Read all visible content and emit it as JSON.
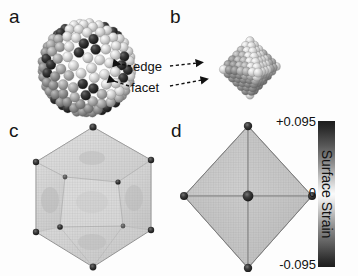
{
  "figure": {
    "panels": [
      {
        "id": "a",
        "letter": "a",
        "kind": "atomistic-icosahedron"
      },
      {
        "id": "b",
        "letter": "b",
        "kind": "atomistic-octahedron"
      },
      {
        "id": "c",
        "letter": "c",
        "kind": "continuum-icosahedron"
      },
      {
        "id": "d",
        "letter": "d",
        "kind": "continuum-octahedron"
      }
    ],
    "annotations": [
      {
        "name": "edge",
        "label": "edge"
      },
      {
        "name": "facet",
        "label": "facet"
      }
    ],
    "caption_sliver": ""
  },
  "colorbar": {
    "title": "Surface Strain",
    "max_label": "+0.095",
    "mid_label": "0",
    "min_label": "-0.095",
    "max_value": 0.095,
    "mid_value": 0,
    "min_value": -0.095,
    "colors": {
      "high": "#1d1d1d",
      "zero": "#fbfbfb",
      "low": "#1d1d1d"
    }
  },
  "chart_data": {
    "type": "heatmap",
    "colorbar_label": "Surface Strain",
    "colorbar_ticks": [
      "+0.095",
      "0",
      "-0.095"
    ],
    "vmin": -0.095,
    "vmax": 0.095,
    "colormap": "gray-symmetric (dark at both extremes, white at zero)",
    "panels": [
      {
        "label": "a",
        "description": "Atomistic icosahedral nanoparticle, spheres colored by surface strain",
        "shape": "icosahedron",
        "features": [
          "edge",
          "facet",
          "vertex"
        ],
        "vertex_strain": 0.095,
        "facet_strain": 0.0
      },
      {
        "label": "b",
        "description": "Atomistic octahedral nanoparticle, spheres colored by surface strain",
        "shape": "octahedron",
        "features": [
          "edge",
          "facet",
          "vertex"
        ],
        "vertex_strain": -0.095,
        "facet_strain": 0.0
      },
      {
        "label": "c",
        "description": "Continuum surface strain map of icosahedron, fine mesh",
        "shape": "icosahedron",
        "vertex_strain": 0.095,
        "facet_strain": 0.0
      },
      {
        "label": "d",
        "description": "Continuum surface strain map of octahedron, fine mesh",
        "shape": "octahedron",
        "vertex_strain": 0.095,
        "center_strain": 0.095,
        "facet_strain": 0.0
      }
    ],
    "grid": false,
    "legend_position": "right"
  }
}
